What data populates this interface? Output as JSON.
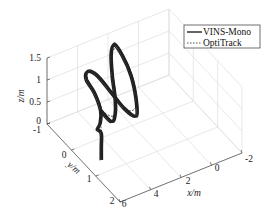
{
  "chart_data": {
    "type": "line",
    "subtype": "3d-trajectory",
    "title": "",
    "xlabel": "x/m",
    "ylabel": "y/m",
    "zlabel": "z/m",
    "xlim": [
      -2,
      6
    ],
    "ylim": [
      -1,
      2
    ],
    "zlim": [
      0,
      1.5
    ],
    "xticks": [
      "-2",
      "0",
      "2",
      "4",
      "6"
    ],
    "yticks": [
      "-1",
      "0",
      "1",
      "2"
    ],
    "zticks": [
      "0",
      "0.5",
      "1",
      "1.5"
    ],
    "grid": true,
    "legend": {
      "placement": "top-right",
      "entries": [
        {
          "label": "VINS-Mono",
          "style": "solid"
        },
        {
          "label": "OptiTrack",
          "style": "dashed"
        }
      ]
    },
    "series": [
      {
        "name": "VINS-Mono",
        "style": "solid",
        "color": "#222222",
        "description": "Figure-eight loops traced repeatedly in 3D, starting from a vertical takeoff near x=5, y=0.5",
        "points": [
          [
            5.0,
            0.6,
            0.0
          ],
          [
            5.0,
            0.6,
            0.3
          ],
          [
            5.0,
            0.6,
            0.6
          ],
          [
            5.1,
            0.5,
            0.65
          ],
          [
            4.6,
            0.3,
            0.6
          ],
          [
            4.4,
            0.2,
            0.8
          ],
          [
            4.5,
            0.0,
            1.1
          ],
          [
            4.7,
            -0.2,
            1.3
          ],
          [
            4.5,
            -0.3,
            1.4
          ],
          [
            4.0,
            -0.2,
            1.3
          ],
          [
            3.5,
            0.1,
            1.0
          ],
          [
            3.0,
            0.3,
            0.7
          ],
          [
            2.4,
            0.4,
            0.5
          ],
          [
            1.9,
            0.1,
            0.6
          ],
          [
            1.6,
            -0.3,
            0.9
          ],
          [
            1.7,
            -0.6,
            1.2
          ],
          [
            2.1,
            -0.7,
            1.45
          ],
          [
            2.6,
            -0.5,
            1.4
          ],
          [
            3.0,
            -0.2,
            1.15
          ],
          [
            3.3,
            0.1,
            0.9
          ],
          [
            3.6,
            0.3,
            0.7
          ],
          [
            4.0,
            0.4,
            0.6
          ],
          [
            4.4,
            0.2,
            0.8
          ]
        ]
      },
      {
        "name": "OptiTrack",
        "style": "dashed",
        "color": "#222222",
        "description": "Ground-truth trajectory closely overlapping VINS-Mono",
        "points": [
          [
            5.0,
            0.6,
            0.0
          ],
          [
            5.0,
            0.6,
            0.6
          ],
          [
            4.6,
            0.3,
            0.6
          ],
          [
            4.4,
            0.2,
            0.8
          ],
          [
            4.5,
            0.0,
            1.1
          ],
          [
            4.6,
            -0.25,
            1.35
          ],
          [
            4.0,
            -0.2,
            1.3
          ],
          [
            3.0,
            0.3,
            0.7
          ],
          [
            1.9,
            0.1,
            0.6
          ],
          [
            1.7,
            -0.6,
            1.2
          ],
          [
            2.6,
            -0.5,
            1.4
          ],
          [
            3.6,
            0.3,
            0.7
          ],
          [
            4.4,
            0.2,
            0.8
          ]
        ]
      }
    ]
  }
}
